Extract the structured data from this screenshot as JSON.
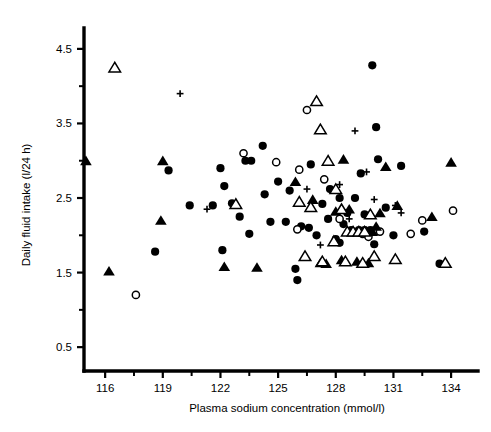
{
  "figure": {
    "background": "#ffffff",
    "ink": "#000000",
    "width": 491,
    "height": 432
  },
  "chart_data": {
    "type": "scatter",
    "title": "",
    "xlabel": "Plasma sodium concentration (mmol/l)",
    "ylabel": "Daily fluid intake (l/24 h)",
    "xlim": [
      114.9,
      135.4
    ],
    "ylim": [
      0.18,
      4.78
    ],
    "xticks": [
      116,
      119,
      122,
      125,
      128,
      131,
      134
    ],
    "xtick_labels": [
      "116",
      "119",
      "122",
      "125",
      "128",
      "131",
      "134"
    ],
    "x_minor_ticks": [
      117.5,
      120.5,
      123.5,
      126.5,
      129.5,
      132.5
    ],
    "yticks": [
      0.5,
      1.5,
      2.5,
      3.5,
      4.5
    ],
    "ytick_labels": [
      "0.5",
      "1.5",
      "2.5",
      "3.5",
      "4.5"
    ],
    "y_minor_ticks": [
      1.0,
      2.0,
      3.0,
      4.0
    ],
    "grid": false,
    "legend_position": "none",
    "series": [
      {
        "name": "filled-circle",
        "marker": "filled-circle",
        "points": [
          [
            118.6,
            1.78
          ],
          [
            119.3,
            2.87
          ],
          [
            122.0,
            2.9
          ],
          [
            122.1,
            1.8
          ],
          [
            122.2,
            2.66
          ],
          [
            123.3,
            3.0
          ],
          [
            123.6,
            3.0
          ],
          [
            121.6,
            2.4
          ],
          [
            122.6,
            2.43
          ],
          [
            123.0,
            2.25
          ],
          [
            124.2,
            3.2
          ],
          [
            124.3,
            2.55
          ],
          [
            123.5,
            2.02
          ],
          [
            124.6,
            2.18
          ],
          [
            125.0,
            2.72
          ],
          [
            125.4,
            2.18
          ],
          [
            126.2,
            2.12
          ],
          [
            126.6,
            2.1
          ],
          [
            125.9,
            1.55
          ],
          [
            126.0,
            1.4
          ],
          [
            126.7,
            2.95
          ],
          [
            127.3,
            2.42
          ],
          [
            127.6,
            2.22
          ],
          [
            127.7,
            2.62
          ],
          [
            128.0,
            1.95
          ],
          [
            128.2,
            1.9
          ],
          [
            128.6,
            2.3
          ],
          [
            128.2,
            2.5
          ],
          [
            128.8,
            2.07
          ],
          [
            129.2,
            2.07
          ],
          [
            129.5,
            2.07
          ],
          [
            129.8,
            2.07
          ],
          [
            129.3,
            2.83
          ],
          [
            129.5,
            2.28
          ],
          [
            130.0,
            1.88
          ],
          [
            129.9,
            4.28
          ],
          [
            130.2,
            3.02
          ],
          [
            130.6,
            2.37
          ],
          [
            131.0,
            2.0
          ],
          [
            131.4,
            2.93
          ],
          [
            129.0,
            2.5
          ],
          [
            130.1,
            3.45
          ],
          [
            132.6,
            2.05
          ],
          [
            133.4,
            1.62
          ],
          [
            120.4,
            2.4
          ],
          [
            125.6,
            2.6
          ],
          [
            127.0,
            2.0
          ],
          [
            128.4,
            2.15
          ]
        ]
      },
      {
        "name": "open-circle",
        "marker": "open-circle",
        "points": [
          [
            117.6,
            1.2
          ],
          [
            123.2,
            3.1
          ],
          [
            124.9,
            2.98
          ],
          [
            126.5,
            3.68
          ],
          [
            126.1,
            2.88
          ],
          [
            127.4,
            2.75
          ],
          [
            128.2,
            2.22
          ],
          [
            129.4,
            2.02
          ],
          [
            130.3,
            2.05
          ],
          [
            132.5,
            2.2
          ],
          [
            134.1,
            2.33
          ],
          [
            126.0,
            2.08
          ],
          [
            129.7,
            1.98
          ],
          [
            131.9,
            2.02
          ]
        ]
      },
      {
        "name": "filled-triangle",
        "marker": "filled-triangle",
        "points": [
          [
            115.0,
            3.0
          ],
          [
            116.2,
            1.52
          ],
          [
            118.9,
            2.2
          ],
          [
            119.0,
            3.0
          ],
          [
            122.2,
            1.58
          ],
          [
            123.9,
            1.57
          ],
          [
            125.9,
            2.72
          ],
          [
            126.8,
            2.48
          ],
          [
            128.0,
            2.32
          ],
          [
            128.4,
            3.02
          ],
          [
            128.7,
            2.35
          ],
          [
            128.9,
            2.05
          ],
          [
            129.3,
            2.05
          ],
          [
            129.6,
            2.05
          ],
          [
            129.9,
            2.05
          ],
          [
            129.1,
            1.65
          ],
          [
            129.7,
            1.63
          ],
          [
            130.3,
            2.3
          ],
          [
            130.6,
            2.92
          ],
          [
            131.2,
            2.4
          ],
          [
            133.0,
            2.25
          ],
          [
            134.0,
            2.98
          ],
          [
            127.2,
            1.63
          ],
          [
            127.5,
            1.62
          ],
          [
            128.3,
            1.67
          ],
          [
            130.1,
            2.12
          ]
        ]
      },
      {
        "name": "open-triangle",
        "marker": "open-triangle",
        "points": [
          [
            116.5,
            4.25
          ],
          [
            122.8,
            2.42
          ],
          [
            126.1,
            2.45
          ],
          [
            126.7,
            2.38
          ],
          [
            127.0,
            3.8
          ],
          [
            127.2,
            3.42
          ],
          [
            127.6,
            3.0
          ],
          [
            128.0,
            2.62
          ],
          [
            128.3,
            2.35
          ],
          [
            128.6,
            2.05
          ],
          [
            128.9,
            2.05
          ],
          [
            129.2,
            2.05
          ],
          [
            129.5,
            2.05
          ],
          [
            129.8,
            2.28
          ],
          [
            127.9,
            1.92
          ],
          [
            128.5,
            1.65
          ],
          [
            129.4,
            1.63
          ],
          [
            130.0,
            1.72
          ],
          [
            131.1,
            1.68
          ],
          [
            133.7,
            1.63
          ],
          [
            126.4,
            1.72
          ],
          [
            127.3,
            1.65
          ]
        ]
      },
      {
        "name": "plus",
        "marker": "plus",
        "points": [
          [
            119.9,
            3.9
          ],
          [
            121.3,
            2.35
          ],
          [
            126.5,
            2.62
          ],
          [
            128.2,
            2.68
          ],
          [
            129.0,
            3.4
          ],
          [
            128.7,
            2.22
          ],
          [
            130.0,
            2.48
          ],
          [
            131.1,
            2.4
          ],
          [
            131.4,
            2.3
          ],
          [
            127.2,
            1.87
          ],
          [
            129.6,
            2.85
          ]
        ]
      }
    ]
  }
}
